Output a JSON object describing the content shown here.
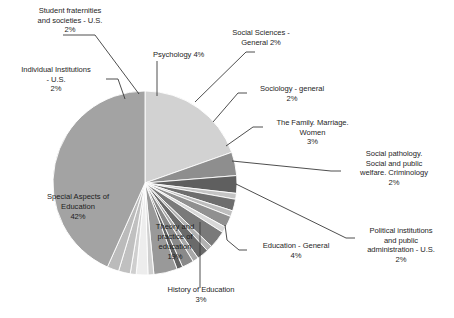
{
  "chart_data": {
    "type": "pie",
    "title": "",
    "units": "percent",
    "legend": "none",
    "labels_position": "outside-with-leader-lines",
    "center": {
      "x": 145,
      "y": 183
    },
    "radius": 92,
    "start_angle_deg": -90,
    "direction": "clockwise",
    "categories": [
      "Theory and practice of education",
      "Education - General",
      "History of Education",
      "Political institutions and public administration - U.S.",
      "Social pathology. Social and public welfare. Criminology",
      "The Family. Marriage. Women",
      "Sociology - general",
      "Social Sciences - General",
      "Psychology",
      "Student fraternities and societies - U.S.",
      "Individual Institutions - U.S.",
      "Special Aspects of Education"
    ],
    "values": [
      19,
      4,
      3,
      2,
      2,
      3,
      2,
      2,
      4,
      2,
      2,
      42
    ],
    "slices": [
      {
        "label": "Theory and practice of education",
        "value": 19,
        "display": "19%",
        "color": "#d2d2d2",
        "label_style": "inside"
      },
      {
        "label": "Education - General",
        "value": 4,
        "display": "4%",
        "color": "#8e8e8e",
        "label_style": "outside"
      },
      {
        "label": "History of Education",
        "value": 3,
        "display": "3%",
        "color": "#5f5f5f",
        "label_style": "outside"
      },
      {
        "label": "unlabeled-sliver-1",
        "value": 1,
        "display": "",
        "color": "#c4c4c4",
        "label_style": "none"
      },
      {
        "label": "Political institutions and public administration - U.S.",
        "value": 2,
        "display": "2%",
        "color": "#6e6e6e",
        "label_style": "outside"
      },
      {
        "label": "unlabeled-sliver-2",
        "value": 1,
        "display": "",
        "color": "#bdbdbd",
        "label_style": "none"
      },
      {
        "label": "Social pathology. Social and public welfare. Criminology",
        "value": 2,
        "display": "2%",
        "color": "#909090",
        "label_style": "outside"
      },
      {
        "label": "unlabeled-sliver-3",
        "value": 1,
        "display": "",
        "color": "#d8d8d8",
        "label_style": "none"
      },
      {
        "label": "The Family. Marriage. Women",
        "value": 3,
        "display": "3%",
        "color": "#7a7a7a",
        "label_style": "outside"
      },
      {
        "label": "unlabeled-sliver-4",
        "value": 1,
        "display": "",
        "color": "#b2b2b2",
        "label_style": "none"
      },
      {
        "label": "Sociology - general",
        "value": 2,
        "display": "2%",
        "color": "#6a6a6a",
        "label_style": "outside"
      },
      {
        "label": "unlabeled-sliver-5",
        "value": 1,
        "display": "",
        "color": "#a8a8a8",
        "label_style": "none"
      },
      {
        "label": "Social Sciences - General",
        "value": 2,
        "display": "2%",
        "color": "#8a8a8a",
        "label_style": "outside"
      },
      {
        "label": "unlabeled-sliver-6",
        "value": 1,
        "display": "",
        "color": "#616161",
        "label_style": "none"
      },
      {
        "label": "Psychology",
        "value": 4,
        "display": "4%",
        "color": "#999999",
        "label_style": "outside"
      },
      {
        "label": "unlabeled-sliver-7",
        "value": 1,
        "display": "",
        "color": "#d0d0d0",
        "label_style": "none"
      },
      {
        "label": "Student fraternities and societies - U.S.",
        "value": 2,
        "display": "2%",
        "color": "#ededed",
        "label_style": "outside"
      },
      {
        "label": "unlabeled-sliver-8",
        "value": 1,
        "display": "",
        "color": "#cfcfcf",
        "label_style": "none"
      },
      {
        "label": "Individual Institutions - U.S.",
        "value": 2,
        "display": "2%",
        "color": "#c0c0c0",
        "label_style": "outside"
      },
      {
        "label": "unlabeled-sliver-9",
        "value": 2,
        "display": "",
        "color": "#bbbbbb",
        "label_style": "none"
      },
      {
        "label": "Special Aspects of Education",
        "value": 42,
        "display": "42%",
        "color": "#a3a3a3",
        "label_style": "inside"
      }
    ]
  },
  "labels": {
    "student_fraternities": "Student fraternities\nand societies - U.S.\n2%",
    "individual_institutions": "Individual Institutions\n- U.S.\n2%",
    "psychology": "Psychology 4%",
    "social_sciences_general": "Social Sciences -\nGeneral  2%",
    "sociology_general": "Sociology - general\n2%",
    "family_marriage_women": "The Family. Marriage.\nWomen\n3%",
    "social_pathology": "Social pathology.\nSocial and public\nwelfare. Criminology\n2%",
    "political_institutions": "Political institutions\nand public\nadministration - U.S.\n2%",
    "education_general": "Education - General\n4%",
    "history_of_education": "History of Education\n3%",
    "special_aspects": "Special Aspects of\nEducation\n42%",
    "theory_practice": "Theory and\npractice of\neducation\n19%"
  },
  "colors": {
    "text": "#262626",
    "leader_line": "#3a3a3a",
    "background": "#ffffff"
  }
}
